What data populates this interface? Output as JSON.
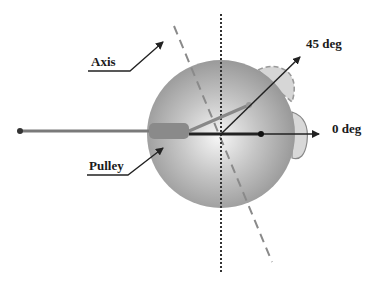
{
  "labels": {
    "axis": "Axis",
    "pulley": "Pulley",
    "deg45": "45 deg",
    "deg0": "0 deg"
  },
  "colors": {
    "background": "#ffffff",
    "sphere_light": "#f4f4f4",
    "sphere_dark": "#8a8a8a",
    "rod": "#7a7a7a",
    "arrow": "#222222",
    "dashed_axis": "#888888",
    "dotted_vertical": "#333333",
    "bump_fill": "#d8d8d8"
  }
}
